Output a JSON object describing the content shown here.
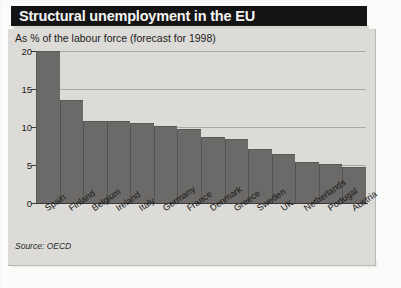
{
  "header": {
    "title": "Structural unemployment in the EU"
  },
  "figure": {
    "subtitle": "As % of the labour force (forecast for 1998)",
    "source": "Source: OECD"
  },
  "colors": {
    "title_bar": "#141414",
    "title_text": "#f4f4f4",
    "panel_background": "#dcdbd7",
    "bar_fill": "#6b6a68",
    "gridline": "#a9a8a3",
    "axis": "#3a3a3a"
  },
  "chart_data": {
    "type": "bar",
    "title": "Structural unemployment in the EU",
    "subtitle": "As % of the labour force (forecast for 1998)",
    "xlabel": "",
    "ylabel": "As % of the labour force",
    "ylim": [
      0,
      20
    ],
    "yticks": [
      0,
      5,
      10,
      15,
      20
    ],
    "ytick_labels": [
      "0",
      "5",
      "10",
      "15",
      "20"
    ],
    "grid": true,
    "legend": false,
    "source": "Source: OECD",
    "categories": [
      "Spain",
      "Finland",
      "Belgium",
      "Ireland",
      "Italy",
      "Germany",
      "France",
      "Denmark",
      "Greece",
      "Sweden",
      "UK",
      "Netherlands",
      "Portugal",
      "Austria"
    ],
    "values": [
      20.0,
      13.5,
      10.8,
      10.8,
      10.5,
      10.1,
      9.7,
      8.7,
      8.4,
      7.1,
      6.4,
      5.4,
      5.1,
      4.7
    ]
  }
}
